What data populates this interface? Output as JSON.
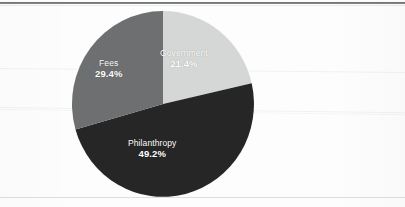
{
  "chart_data": {
    "type": "pie",
    "title": "",
    "subtitle": "",
    "xlabel": "",
    "ylabel": "",
    "legend_position": "none",
    "grid": false,
    "units": "percent",
    "start_angle_deg": 0,
    "direction": "clockwise",
    "categories": [
      "Government",
      "Philanthropy",
      "Fees"
    ],
    "values": [
      21.4,
      49.2,
      29.4
    ],
    "labels": [
      "21.4%",
      "49.2%",
      "29.4%"
    ],
    "colors": [
      "#d5d6d6",
      "#262626",
      "#6e6f70"
    ],
    "slices": [
      {
        "name": "Government",
        "value": 21.4,
        "label": "21.4%",
        "color": "#d5d6d6",
        "label_color": "#ffffff",
        "start_deg": 0.0,
        "end_deg": 77.04
      },
      {
        "name": "Philanthropy",
        "value": 49.2,
        "label": "49.2%",
        "color": "#262626",
        "label_color": "#ffffff",
        "start_deg": 77.04,
        "end_deg": 254.16
      },
      {
        "name": "Fees",
        "value": 29.4,
        "label": "29.4%",
        "color": "#6e6f70",
        "label_color": "#ffffff",
        "start_deg": 254.16,
        "end_deg": 360.0
      }
    ]
  },
  "page": {
    "background_color": "#fdfdfd",
    "rule_color_top": "#56585a",
    "rule_color_bottom": "#dddede"
  }
}
